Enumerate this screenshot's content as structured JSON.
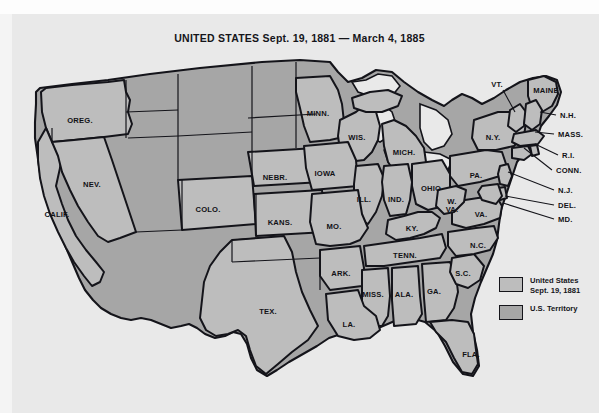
{
  "map": {
    "title": "UNITED STATES Sept. 19, 1881 — March 4, 1885",
    "background_color": "#e9e9e9",
    "state_fill": "#bdbdbd",
    "territory_fill": "#a6a6a6",
    "outline_color": "#14141a"
  },
  "legend": {
    "items": [
      {
        "label_line1": "United States",
        "label_line2": "Sept. 19, 1881",
        "swatch": "state-swatch",
        "color": "#bdbdbd"
      },
      {
        "label_line1": "U.S. Territory",
        "label_line2": "",
        "swatch": "territory-swatch",
        "color": "#a6a6a6"
      }
    ]
  },
  "state_labels": [
    {
      "name": "oregon",
      "text": "OREG.",
      "x": 80,
      "y": 120
    },
    {
      "name": "nevada",
      "text": "NEV.",
      "x": 92,
      "y": 184
    },
    {
      "name": "california",
      "text": "CALIF.",
      "x": 57,
      "y": 214
    },
    {
      "name": "colorado",
      "text": "COLO.",
      "x": 208,
      "y": 209
    },
    {
      "name": "nebraska",
      "text": "NEBR.",
      "x": 275,
      "y": 177
    },
    {
      "name": "kansas",
      "text": "KANS.",
      "x": 280,
      "y": 222
    },
    {
      "name": "minnesota",
      "text": "MINN.",
      "x": 318,
      "y": 113
    },
    {
      "name": "wisconsin",
      "text": "WIS.",
      "x": 357,
      "y": 137
    },
    {
      "name": "iowa",
      "text": "IOWA",
      "x": 325,
      "y": 173
    },
    {
      "name": "michigan",
      "text": "MICH.",
      "x": 404,
      "y": 152
    },
    {
      "name": "illinois",
      "text": "ILL.",
      "x": 364,
      "y": 199
    },
    {
      "name": "indiana",
      "text": "IND.",
      "x": 396,
      "y": 199
    },
    {
      "name": "ohio",
      "text": "OHIO",
      "x": 431,
      "y": 188
    },
    {
      "name": "missouri",
      "text": "MO.",
      "x": 334,
      "y": 226
    },
    {
      "name": "kentucky",
      "text": "KY.",
      "x": 412,
      "y": 228
    },
    {
      "name": "tennessee",
      "text": "TENN.",
      "x": 405,
      "y": 255
    },
    {
      "name": "arkansas",
      "text": "ARK.",
      "x": 341,
      "y": 273
    },
    {
      "name": "mississippi",
      "text": "MISS.",
      "x": 373,
      "y": 294
    },
    {
      "name": "alabama",
      "text": "ALA.",
      "x": 404,
      "y": 294
    },
    {
      "name": "georgia",
      "text": "GA.",
      "x": 434,
      "y": 291
    },
    {
      "name": "louisiana",
      "text": "LA.",
      "x": 349,
      "y": 324
    },
    {
      "name": "texas",
      "text": "TEX.",
      "x": 268,
      "y": 311
    },
    {
      "name": "florida",
      "text": "FLA.",
      "x": 471,
      "y": 354
    },
    {
      "name": "south-carolina",
      "text": "S.C.",
      "x": 463,
      "y": 273
    },
    {
      "name": "north-carolina",
      "text": "N.C.",
      "x": 478,
      "y": 245
    },
    {
      "name": "virginia",
      "text": "VA.",
      "x": 481,
      "y": 214
    },
    {
      "name": "pennsylvania",
      "text": "PA.",
      "x": 476,
      "y": 175
    },
    {
      "name": "new-york",
      "text": "N.Y.",
      "x": 493,
      "y": 137
    },
    {
      "name": "maine",
      "text": "MAINE",
      "x": 546,
      "y": 90
    }
  ],
  "split_labels": [
    {
      "name": "west-virginia",
      "line1": "W.",
      "line2": "VA.",
      "x": 452,
      "y": 206
    }
  ],
  "leader_labels": [
    {
      "name": "vermont",
      "text": "VT.",
      "tx": 497,
      "ty": 84,
      "lx1": 503,
      "ly1": 90,
      "lx2": 515,
      "ly2": 112
    },
    {
      "name": "new-hampshire",
      "text": "N.H.",
      "tx": 560,
      "ty": 115,
      "lx1": 556,
      "ly1": 115,
      "lx2": 540,
      "ly2": 112
    },
    {
      "name": "massachusetts",
      "text": "MASS.",
      "tx": 558,
      "ty": 134,
      "lx1": 554,
      "ly1": 134,
      "lx2": 535,
      "ly2": 132
    },
    {
      "name": "rhode-island",
      "text": "R.I.",
      "tx": 562,
      "ty": 155,
      "lx1": 558,
      "ly1": 155,
      "lx2": 535,
      "ly2": 144
    },
    {
      "name": "connecticut",
      "text": "CONN.",
      "tx": 556,
      "ty": 170,
      "lx1": 552,
      "ly1": 170,
      "lx2": 524,
      "ly2": 148
    },
    {
      "name": "new-jersey",
      "text": "N.J.",
      "tx": 558,
      "ty": 190,
      "lx1": 554,
      "ly1": 190,
      "lx2": 508,
      "ly2": 172
    },
    {
      "name": "delaware",
      "text": "DEL.",
      "tx": 558,
      "ty": 205,
      "lx1": 554,
      "ly1": 205,
      "lx2": 505,
      "ly2": 196
    },
    {
      "name": "maryland",
      "text": "MD.",
      "tx": 558,
      "ty": 219,
      "lx1": 554,
      "ly1": 219,
      "lx2": 503,
      "ly2": 203
    }
  ]
}
